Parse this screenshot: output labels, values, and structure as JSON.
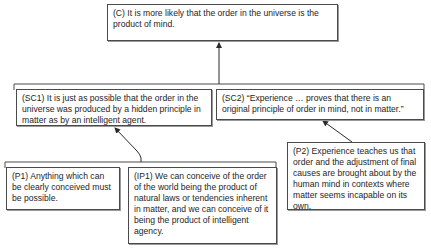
{
  "diagram": {
    "type": "argument-map",
    "conclusion": {
      "id": "C",
      "text": "(C) It is more likely that the order in the universe is the product of mind."
    },
    "sub_conclusions": [
      {
        "id": "SC1",
        "text": "(SC1) It is just as possible that the order in the universe was produced by a hidden principle in matter as by an intelligent agent."
      },
      {
        "id": "SC2",
        "text": "(SC2) “Experience … proves that there is an original principle of order in mind, not in matter.”"
      }
    ],
    "premises": [
      {
        "id": "P1",
        "text": "(P1) Anything which can be clearly conceived must be possible."
      },
      {
        "id": "IP1",
        "text": "(IP1) We can conceive of the order of the world being the product of natural laws or tendencies inherent in matter, and we can conceive of it being the product of intelligent agency."
      },
      {
        "id": "P2",
        "text": "(P2) Experience teaches us that order and the adjustment of final causes are brought about by the human mind in contexts where matter seems incapable on its own."
      }
    ],
    "edges": [
      {
        "from": "SC1+SC2",
        "to": "C",
        "kind": "linked"
      },
      {
        "from": "P1+IP1",
        "to": "SC1",
        "kind": "linked"
      },
      {
        "from": "P2",
        "to": "SC2",
        "kind": "single"
      }
    ],
    "colors": {
      "line": "#4a4a4a",
      "text": "#1e1e1e",
      "background": "#ffffff"
    }
  }
}
